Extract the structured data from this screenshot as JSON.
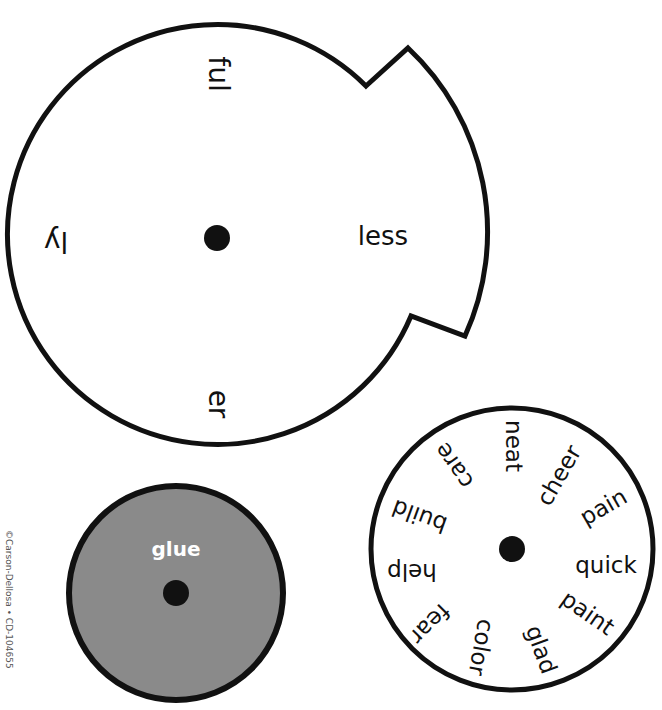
{
  "copyright": "©Carson-Dellosa • CD-104655",
  "colors": {
    "outline": "#111111",
    "paper": "#ffffff",
    "glue_fill": "#8a8a8a",
    "glue_text": "#ffffff"
  },
  "suffix_wheel": {
    "suffixes": [
      {
        "label": "ful",
        "position": "top",
        "rotation": 90
      },
      {
        "label": "less",
        "position": "right",
        "rotation": 0
      },
      {
        "label": "er",
        "position": "bottom",
        "rotation": 90
      },
      {
        "label": "ly",
        "position": "left",
        "rotation": 180
      }
    ]
  },
  "base_word_wheel": {
    "words": [
      {
        "label": "neat",
        "rotation": 90
      },
      {
        "label": "cheer",
        "rotation": 60
      },
      {
        "label": "pain",
        "rotation": 30
      },
      {
        "label": "quick",
        "rotation": 0
      },
      {
        "label": "paint",
        "rotation": 30
      },
      {
        "label": "glad",
        "rotation": 60
      },
      {
        "label": "color",
        "rotation": 90
      },
      {
        "label": "fear",
        "rotation": 135
      },
      {
        "label": "help",
        "rotation": 180
      },
      {
        "label": "build",
        "rotation": 200
      },
      {
        "label": "care",
        "rotation": 240
      }
    ]
  },
  "glue_wheel": {
    "label": "glue"
  }
}
